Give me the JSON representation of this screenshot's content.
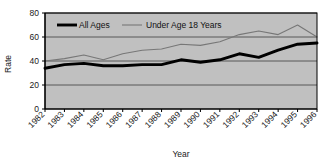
{
  "chart_data": {
    "type": "line",
    "title": "",
    "xlabel": "Year",
    "ylabel": "Rate",
    "ylim": [
      0,
      80
    ],
    "yticks": [
      0,
      20,
      40,
      60,
      80
    ],
    "grid": true,
    "legend_position": "top-left-inside",
    "categories": [
      "1982",
      "1983",
      "1984",
      "1985",
      "1986",
      "1987",
      "1988",
      "1989",
      "1990",
      "1991",
      "1992",
      "1993",
      "1994",
      "1995",
      "1996"
    ],
    "series": [
      {
        "name": "All Ages",
        "style": "thick-black-line",
        "color": "#000000",
        "values": [
          34,
          37,
          38,
          36,
          36,
          37,
          37,
          41,
          39,
          41,
          46,
          43,
          49,
          54,
          55
        ]
      },
      {
        "name": "Under Age 18 Years",
        "style": "thin-gray-line",
        "color": "#777777",
        "values": [
          40,
          42,
          45,
          41,
          46,
          49,
          50,
          54,
          53,
          56,
          62,
          65,
          62,
          70,
          60
        ]
      }
    ]
  },
  "axes": {
    "y_label": "Rate",
    "x_label": "Year",
    "y_tick_labels": [
      "0",
      "20",
      "40",
      "60",
      "80"
    ],
    "x_tick_labels": [
      "1982",
      "1983",
      "1984",
      "1985",
      "1986",
      "1987",
      "1988",
      "1989",
      "1990",
      "1991",
      "1992",
      "1993",
      "1994",
      "1995",
      "1996"
    ]
  },
  "legend": {
    "items": [
      {
        "label": "All Ages"
      },
      {
        "label": "Under Age 18 Years"
      }
    ]
  },
  "colors": {
    "plot_background": "#c0c0c0",
    "grid": "#4d4d4d",
    "frame": "#000000",
    "series_all_ages": "#000000",
    "series_under_18": "#787878",
    "page_background": "#ffffff"
  }
}
